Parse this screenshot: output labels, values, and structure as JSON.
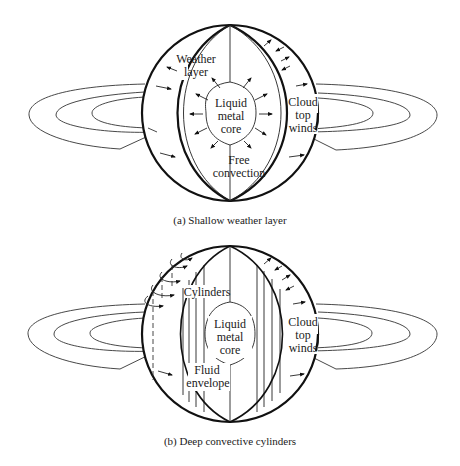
{
  "figure": {
    "panels": [
      {
        "id": "a",
        "caption": "(a)  Shallow weather layer",
        "labels": {
          "weather_layer_1": "Weather",
          "weather_layer_2": "layer",
          "core_1": "Liquid",
          "core_2": "metal",
          "core_3": "core",
          "convection_1": "Free",
          "convection_2": "convection",
          "winds_1": "Cloud",
          "winds_2": "top",
          "winds_3": "winds"
        }
      },
      {
        "id": "b",
        "caption": "(b)  Deep convective cylinders",
        "labels": {
          "cylinders": "Cylinders",
          "core_1": "Liquid",
          "core_2": "metal",
          "core_3": "core",
          "envelope_1": "Fluid",
          "envelope_2": "envelope",
          "winds_1": "Cloud",
          "winds_2": "top",
          "winds_3": "winds"
        }
      }
    ],
    "colors": {
      "ink": "#111111",
      "background": "#ffffff"
    }
  }
}
